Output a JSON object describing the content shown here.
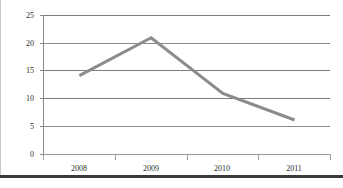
{
  "chart_data": {
    "type": "line",
    "title": "",
    "xlabel": "",
    "ylabel": "",
    "categories": [
      "2008",
      "2009",
      "2010",
      "2011"
    ],
    "values": [
      14.2,
      21.0,
      11.0,
      6.2
    ],
    "series": [
      {
        "name": "Series 1",
        "values": [
          14.2,
          21.0,
          11.0,
          6.2
        ]
      }
    ],
    "ylim": [
      0,
      25
    ],
    "ytick_labels": [
      "0",
      "5",
      "10",
      "15",
      "20",
      "25"
    ],
    "ytick_values": [
      0,
      5,
      10,
      15,
      20,
      25
    ],
    "xtick_labels": [
      "2008",
      "2009",
      "2010",
      "2011"
    ],
    "grid": true,
    "grid_axis": "y",
    "legend": false,
    "legend_position": "none",
    "colors": {
      "line": "#8c8c8c",
      "gridline": "#808080",
      "axis": "#808080",
      "tick_text": "#2b2b2b",
      "background": "#ffffff",
      "frame_bottom": "#3a3a3a"
    },
    "line_width": 3,
    "markers": false
  }
}
